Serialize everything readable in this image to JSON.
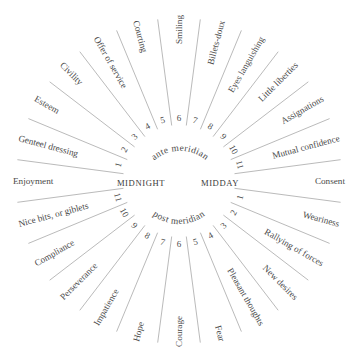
{
  "diagram": {
    "center_labels": {
      "left": "MIDNIGHT",
      "right": "MIDDAY"
    },
    "arc_labels": {
      "top": "ante meridian",
      "bottom": "post meridian"
    },
    "ante_meridian_hours": [
      "1",
      "2",
      "3",
      "4",
      "5",
      "6",
      "7",
      "8",
      "9",
      "10",
      "11"
    ],
    "post_meridian_hours": [
      "1",
      "2",
      "3",
      "4",
      "5",
      "6",
      "7",
      "8",
      "9",
      "10",
      "11"
    ],
    "sectors": [
      {
        "angle": 0,
        "label": "Consent"
      },
      {
        "angle": 15,
        "label": "Mutual confidence"
      },
      {
        "angle": 30,
        "label": "Assignations"
      },
      {
        "angle": 45,
        "label": "Little liberties"
      },
      {
        "angle": 60,
        "label": "Eyes languishing"
      },
      {
        "angle": 75,
        "label": "Billets-doux"
      },
      {
        "angle": 90,
        "label": "Smiling"
      },
      {
        "angle": 105,
        "label": "Courting"
      },
      {
        "angle": 120,
        "label": "Offer of service"
      },
      {
        "angle": 135,
        "label": "Civility"
      },
      {
        "angle": 150,
        "label": "Esteem"
      },
      {
        "angle": 165,
        "label": "Genteel dressing"
      },
      {
        "angle": 180,
        "label": "Enjoyment"
      },
      {
        "angle": 195,
        "label": "Nice bits, or giblets"
      },
      {
        "angle": 210,
        "label": "Compliance"
      },
      {
        "angle": 225,
        "label": "Perseverance"
      },
      {
        "angle": 240,
        "label": "Impatience"
      },
      {
        "angle": 255,
        "label": "Hope"
      },
      {
        "angle": 270,
        "label": "Courage"
      },
      {
        "angle": 285,
        "label": "Fear"
      },
      {
        "angle": 300,
        "label": "Pleasant thoughts"
      },
      {
        "angle": 315,
        "label": "New desires"
      },
      {
        "angle": 330,
        "label": "Rallying of forces"
      },
      {
        "angle": 345,
        "label": "Weariness"
      }
    ],
    "colors": {
      "text": "#4a4a4a",
      "spokes": "#a8a8a8",
      "background": "#ffffff"
    }
  }
}
